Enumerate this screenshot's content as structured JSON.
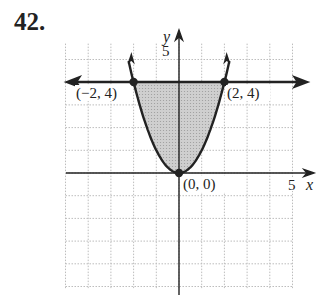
{
  "problem_number": "42.",
  "chart_data": {
    "type": "area",
    "title": "",
    "xlabel": "x",
    "ylabel": "y",
    "xlim": [
      -5,
      5
    ],
    "ylim": [
      -5,
      5
    ],
    "grid": true,
    "tick_labels": {
      "x": [
        "5"
      ],
      "y": [
        "5"
      ]
    },
    "series": [
      {
        "name": "y = x^2",
        "kind": "curve",
        "x": [
          -2.2,
          -2,
          -1,
          0,
          1,
          2,
          2.2
        ],
        "y": [
          4.84,
          4,
          1,
          0,
          1,
          4,
          4.84
        ],
        "arrows": true
      },
      {
        "name": "y = 4",
        "kind": "line",
        "x": [
          -5,
          5
        ],
        "y": [
          4,
          4
        ],
        "arrows": true
      },
      {
        "name": "shaded region",
        "kind": "fill",
        "description": "x^2 <= y <= 4",
        "x_range": [
          -2,
          2
        ]
      }
    ],
    "points": [
      {
        "label": "(−2, 4)",
        "x": -2,
        "y": 4
      },
      {
        "label": "(2, 4)",
        "x": 2,
        "y": 4
      },
      {
        "label": "(0, 0)",
        "x": 0,
        "y": 0
      }
    ],
    "colors": {
      "fill": "#c8c8c8",
      "line": "#222222",
      "grid": "#bbbbbb"
    }
  },
  "labels": {
    "x_axis": "x",
    "y_axis": "y",
    "x_tick": "5",
    "y_tick": "5",
    "pt_left": "(−2, 4)",
    "pt_right": "(2, 4)",
    "pt_origin": "(0, 0)"
  }
}
